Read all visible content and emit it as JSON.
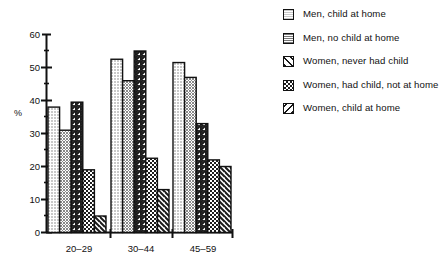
{
  "chart_data": {
    "type": "bar",
    "title": "",
    "subtitle": "",
    "xlabel": "",
    "ylabel": "%",
    "ylim": [
      0,
      60
    ],
    "yticks": [
      0,
      10,
      20,
      30,
      40,
      50,
      60
    ],
    "ytick_labels": [
      "0",
      "10",
      "20",
      "30",
      "40",
      "50",
      "60"
    ],
    "grid": false,
    "legend_position": "right",
    "categories": [
      "20–29",
      "30–44",
      "45–59"
    ],
    "series": [
      {
        "name": "Men, child at home",
        "pattern": "light-stipple",
        "values": [
          38,
          52.5,
          51.5
        ]
      },
      {
        "name": "Men, no child at home",
        "pattern": "dark-stipple",
        "values": [
          31,
          46,
          47
        ]
      },
      {
        "name": "Women, never had child",
        "pattern": "diagonal-hatch-forward",
        "values": [
          39.5,
          55,
          33
        ]
      },
      {
        "name": "Women, had child, not at home",
        "pattern": "checkerboard",
        "values": [
          19,
          22.5,
          22
        ]
      },
      {
        "name": "Women, child at home",
        "pattern": "diagonal-hatch-backward",
        "values": [
          5,
          13,
          20
        ]
      }
    ]
  },
  "legend": {
    "items": [
      {
        "label": "Men, child at home"
      },
      {
        "label": "Men, no child at home"
      },
      {
        "label": "Women, never had child"
      },
      {
        "label": "Women, had child, not at home"
      },
      {
        "label": "Women, child at home"
      }
    ]
  },
  "colors": {
    "axis": "#111111",
    "bar_outline": "#111111",
    "background": "#ffffff",
    "light_fill": "#d8d8d8",
    "dark_fill": "#9a9a9a"
  }
}
